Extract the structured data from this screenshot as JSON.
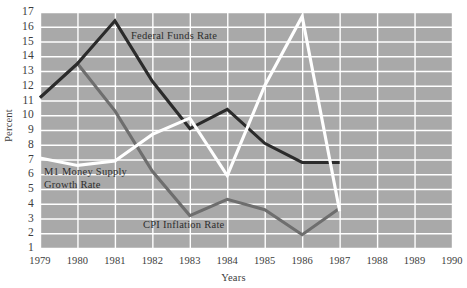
{
  "chart_data": {
    "type": "line",
    "title": "",
    "xlabel": "Years",
    "ylabel": "Percent",
    "x": [
      1979,
      1980,
      1981,
      1982,
      1983,
      1984,
      1985,
      1986,
      1987
    ],
    "xlim": [
      1979,
      1990
    ],
    "ylim": [
      1,
      17
    ],
    "xticks": [
      "1979",
      "1980",
      "1981",
      "1982",
      "1983",
      "1984",
      "1985",
      "1986",
      "1987",
      "1988",
      "1989",
      "1990"
    ],
    "yticks": [
      "17",
      "16",
      "15",
      "14",
      "13",
      "12",
      "11",
      "10",
      "9",
      "8",
      "7",
      "6",
      "5",
      "4",
      "3",
      "2",
      "1"
    ],
    "grid": true,
    "legend_position": "inline-annotations",
    "plot_background": "#a9a9a9",
    "gridline_color": "#ffffff",
    "series": [
      {
        "name": "Federal Funds Rate",
        "color": "#2b2b2b",
        "values": [
          11.2,
          13.5,
          16.4,
          12.3,
          9.1,
          10.4,
          8.1,
          6.8,
          6.8
        ]
      },
      {
        "name": "M1 Money Supply Growth Rate",
        "color": "#ffffff",
        "values": [
          7.1,
          6.6,
          6.9,
          8.7,
          9.8,
          5.9,
          12.0,
          16.7,
          3.5
        ]
      },
      {
        "name": "CPI Inflation Rate",
        "color": "#6e6e6e",
        "values": [
          11.2,
          13.5,
          10.3,
          6.2,
          3.2,
          4.3,
          3.6,
          1.9,
          3.7
        ]
      }
    ],
    "annotations": [
      {
        "name": "federal-funds-rate-label",
        "text": "Federal Funds Rate"
      },
      {
        "name": "m1-money-supply-label",
        "line1": "M1 Money Supply",
        "line2": "Growth Rate"
      },
      {
        "name": "cpi-inflation-rate-label",
        "text": "CPI Inflation Rate"
      }
    ]
  }
}
